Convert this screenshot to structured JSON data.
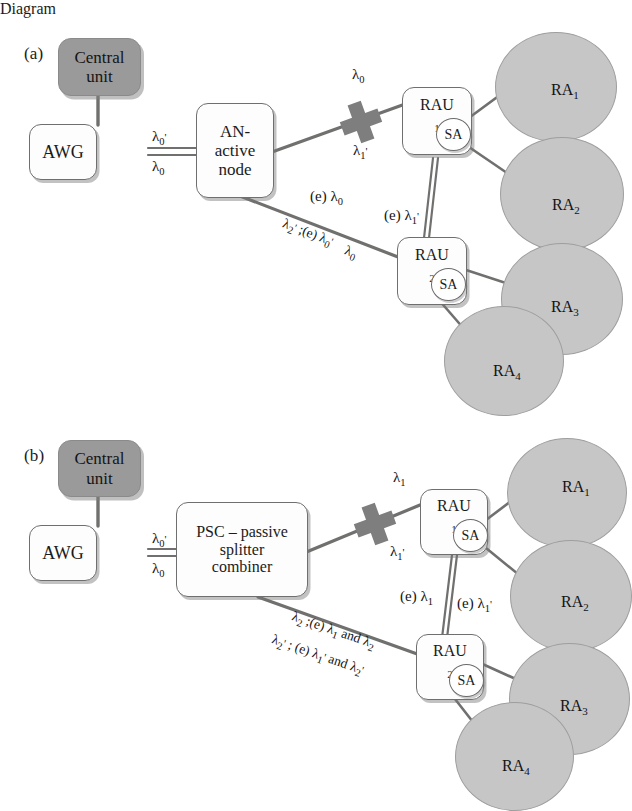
{
  "figure": {
    "type": "network-architecture-diagram",
    "panels": [
      {
        "id": "a",
        "label": "(a)",
        "nodes": {
          "central_unit": "Central\nunit",
          "central_unit_line1": "Central",
          "central_unit_line2": "unit",
          "awg": "AWG",
          "an_line1": "AN-",
          "an_line2": "active",
          "an_line3": "node",
          "rau1": "RAU",
          "rau1_sub": "1",
          "rau2": "RAU",
          "rau2_sub": "2",
          "sa": "SA"
        },
        "link_labels": {
          "awg_up": "λ0'",
          "awg_down": "λ0",
          "cross_top": "λ0",
          "cross_bottom": "λ1'",
          "e_lambda0": "(e) λ0",
          "e_lambda1p": "(e) λ1'",
          "diag_line1": "λ2' ;(e) λ0'",
          "diag_line2": "λ0"
        },
        "cells": [
          {
            "label": "RA",
            "sub": "1"
          },
          {
            "label": "RA",
            "sub": "2"
          },
          {
            "label": "RA",
            "sub": "3"
          },
          {
            "label": "RA",
            "sub": "4"
          }
        ]
      },
      {
        "id": "b",
        "label": "(b)",
        "nodes": {
          "central_unit_line1": "Central",
          "central_unit_line2": "unit",
          "awg": "AWG",
          "psc_line1": "PSC – passive",
          "psc_line2": "splitter",
          "psc_line3": "combiner",
          "rau1": "RAU",
          "rau1_sub": "1",
          "rau2": "RAU",
          "rau2_sub": "2",
          "sa": "SA"
        },
        "link_labels": {
          "awg_up": "λ0'",
          "awg_down": "λ0",
          "cross_top": "λ1",
          "cross_bottom": "λ1'",
          "e_lambda1": "(e) λ1",
          "e_lambda1p": "(e) λ1'",
          "diag_line1": "λ2 ;(e) λ1 and λ2",
          "diag_line2": "λ2' ; (e) λ1' and λ2'"
        },
        "cells": [
          {
            "label": "RA",
            "sub": "1"
          },
          {
            "label": "RA",
            "sub": "2"
          },
          {
            "label": "RA",
            "sub": "3"
          },
          {
            "label": "RA",
            "sub": "4"
          }
        ]
      }
    ],
    "colors": {
      "central_unit_fill": "#9a9a9a",
      "cell_fill": "#c6c6c6",
      "cell_stroke": "#9e9e9e",
      "box_stroke": "#6f6f6f",
      "link_stroke": "#70706e",
      "cross_fill": "#7e7e7e",
      "background": "#ffffff"
    }
  }
}
